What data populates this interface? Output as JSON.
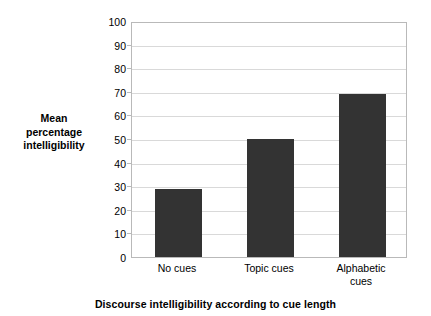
{
  "chart_data": {
    "type": "bar",
    "title": "",
    "categories": [
      "No cues",
      "Topic cues",
      "Alphabetic cues"
    ],
    "category_lines": [
      [
        "No cues"
      ],
      [
        "Topic cues"
      ],
      [
        "Alphabetic",
        "cues"
      ]
    ],
    "values": [
      29,
      50,
      69
    ],
    "xlabel": "Discourse intelligibility according to cue length",
    "ylabel": "Mean percentage intelligibility",
    "ylabel_lines": [
      "Mean",
      "percentage",
      "intelligibility"
    ],
    "ylim": [
      0,
      100
    ],
    "ytick_labels": [
      "100",
      "90",
      "80",
      "70",
      "60",
      "50",
      "40",
      "30",
      "20",
      "10",
      "0"
    ],
    "ytick_values": [
      100,
      90,
      80,
      70,
      60,
      50,
      40,
      30,
      20,
      10,
      0
    ],
    "grid": true,
    "legend": null,
    "bar_color": "#333333",
    "grid_color": "#d9d9d9",
    "axis_color": "#b9b9b9",
    "background_color": "#ffffff"
  }
}
